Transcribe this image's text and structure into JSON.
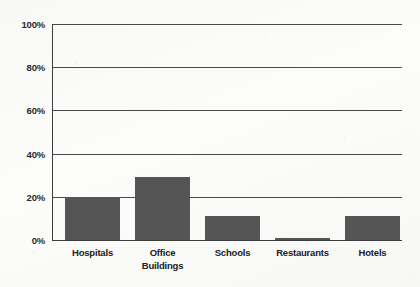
{
  "chart_data": {
    "type": "bar",
    "title": "",
    "subtitle": "",
    "xlabel": "",
    "ylabel": "",
    "categories": [
      "Hospitals",
      "Office Buildings",
      "Schools",
      "Restaurants",
      "Hotels"
    ],
    "category_lines": [
      [
        "Hospitals"
      ],
      [
        "Office",
        "Buildings"
      ],
      [
        "Schools"
      ],
      [
        "Restaurants"
      ],
      [
        "Hotels"
      ]
    ],
    "values": [
      20,
      29,
      11,
      1,
      11
    ],
    "value_unit": "%",
    "ylim": [
      0,
      100
    ],
    "yticks": [
      0,
      20,
      40,
      60,
      80,
      100
    ],
    "ytick_labels": [
      "0%",
      "20%",
      "40%",
      "60%",
      "80%",
      "100%"
    ],
    "grid": "horizontal",
    "legend": "none",
    "series": [
      {
        "name": "",
        "values": [
          20,
          29,
          11,
          1,
          11
        ]
      }
    ],
    "colors": {
      "bar_fill": "#555555",
      "grid": "#4a4a4a",
      "axis": "#3c3c3c",
      "background": "#fcfcfa",
      "text": "#202020"
    }
  }
}
